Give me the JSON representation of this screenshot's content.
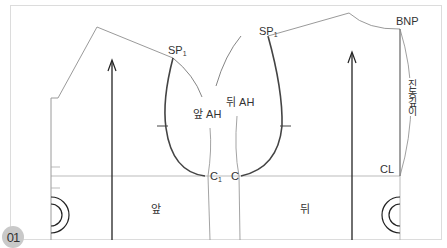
{
  "figure": {
    "step_number": "01",
    "labels": {
      "sp1_front": {
        "main": "SP",
        "sub": "1"
      },
      "sp1_back": {
        "main": "SP",
        "sub": "1"
      },
      "front_ah": "앞 AH",
      "back_ah": "뒤 AH",
      "c1": {
        "main": "C",
        "sub": "1"
      },
      "c": "C",
      "bnp": "BNP",
      "cl": "CL",
      "armhole_depth": "진동깊이",
      "front": "앞",
      "back": "뒤"
    },
    "colors": {
      "frame": "#d8d8d8",
      "pattern_line": "#999999",
      "armhole_curve": "#444444",
      "grainline": "#222222",
      "badge": "#c9c9c9"
    }
  }
}
